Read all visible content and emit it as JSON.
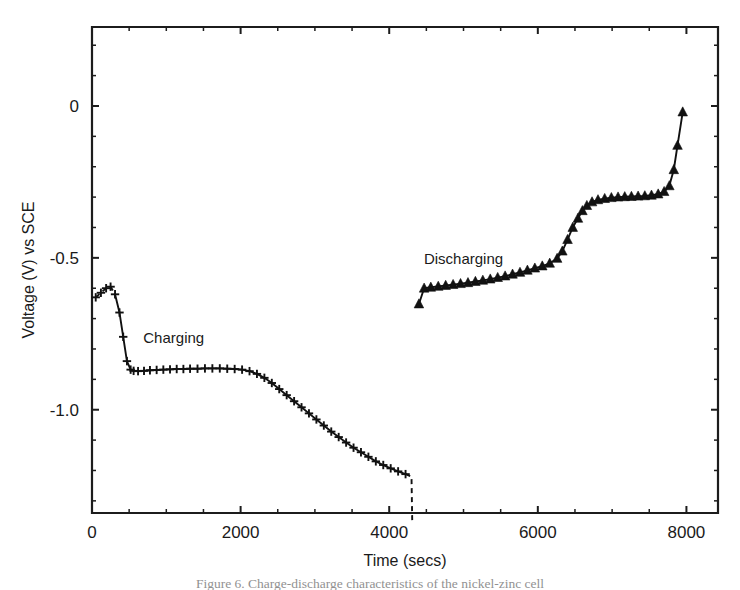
{
  "figure": {
    "caption": "Figure 6. Charge-discharge characteristics of the nickel-zinc cell"
  },
  "chart_data": {
    "type": "line",
    "title": "",
    "xlabel": "Time (secs)",
    "ylabel": "Voltage (V) vs SCE",
    "xlim": [
      0,
      8425
    ],
    "ylim": [
      -1.34,
      0.26
    ],
    "xticks": [
      0,
      2000,
      4000,
      6000,
      8000
    ],
    "xticklabels": [
      "0",
      "2000",
      "4000",
      "6000",
      "8000"
    ],
    "yticks": [
      0,
      -0.5,
      -1.0
    ],
    "yticklabels": [
      "0",
      "-0.5",
      "-1.0"
    ],
    "x_minor_step": 500,
    "y_minor_step": 0.1,
    "grid": false,
    "legend": "none",
    "annotations": [
      {
        "text": "Charging",
        "x": 1100,
        "y": -0.78
      },
      {
        "text": "Discharging",
        "x": 5000,
        "y": -0.52
      }
    ],
    "series": [
      {
        "name": "Charging",
        "marker": "plus",
        "linestyle": "solid-with-dashed-ends",
        "x": [
          50,
          120,
          190,
          250,
          310,
          370,
          420,
          470,
          520,
          560,
          620,
          700,
          780,
          870,
          960,
          1050,
          1140,
          1230,
          1320,
          1420,
          1520,
          1620,
          1720,
          1820,
          1920,
          2020,
          2120,
          2220,
          2320,
          2420,
          2520,
          2620,
          2720,
          2820,
          2920,
          3020,
          3120,
          3220,
          3320,
          3420,
          3520,
          3620,
          3720,
          3820,
          3920,
          4020,
          4120,
          4220,
          4300,
          4310
        ],
        "y": [
          -0.63,
          -0.615,
          -0.6,
          -0.595,
          -0.62,
          -0.68,
          -0.76,
          -0.84,
          -0.868,
          -0.872,
          -0.873,
          -0.872,
          -0.87,
          -0.869,
          -0.868,
          -0.867,
          -0.866,
          -0.866,
          -0.865,
          -0.865,
          -0.864,
          -0.864,
          -0.864,
          -0.865,
          -0.866,
          -0.868,
          -0.873,
          -0.882,
          -0.895,
          -0.912,
          -0.932,
          -0.952,
          -0.972,
          -0.992,
          -1.012,
          -1.032,
          -1.052,
          -1.072,
          -1.09,
          -1.108,
          -1.125,
          -1.14,
          -1.155,
          -1.17,
          -1.182,
          -1.193,
          -1.203,
          -1.212,
          -1.22,
          -1.37
        ],
        "dashed_head_points": 4,
        "dashed_tail_points": 2
      },
      {
        "name": "Discharging",
        "marker": "triangle-up",
        "linestyle": "solid",
        "x": [
          4400,
          4470,
          4560,
          4660,
          4760,
          4860,
          4960,
          5060,
          5160,
          5260,
          5360,
          5460,
          5560,
          5660,
          5760,
          5860,
          5960,
          6060,
          6160,
          6260,
          6330,
          6400,
          6470,
          6540,
          6600,
          6660,
          6730,
          6810,
          6900,
          6990,
          7080,
          7170,
          7260,
          7350,
          7440,
          7530,
          7620,
          7700,
          7770,
          7830,
          7880,
          7950
        ],
        "y": [
          -0.652,
          -0.6,
          -0.597,
          -0.594,
          -0.591,
          -0.588,
          -0.585,
          -0.582,
          -0.578,
          -0.574,
          -0.57,
          -0.565,
          -0.56,
          -0.554,
          -0.548,
          -0.541,
          -0.534,
          -0.527,
          -0.518,
          -0.502,
          -0.478,
          -0.44,
          -0.4,
          -0.37,
          -0.345,
          -0.328,
          -0.316,
          -0.309,
          -0.305,
          -0.302,
          -0.3,
          -0.299,
          -0.298,
          -0.297,
          -0.296,
          -0.294,
          -0.29,
          -0.282,
          -0.263,
          -0.21,
          -0.13,
          -0.02
        ]
      }
    ]
  }
}
